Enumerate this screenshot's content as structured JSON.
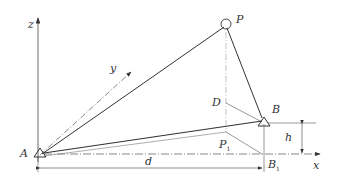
{
  "diagram": {
    "labels": {
      "z": "z",
      "y": "y",
      "x": "x",
      "P": "P",
      "A": "A",
      "B": "B",
      "D": "D",
      "P1": "P",
      "P1_sub": "1",
      "B1": "B",
      "B1_sub": "1",
      "d": "d",
      "h": "h"
    },
    "colors": {
      "line": "#333333",
      "thin": "#888888"
    }
  }
}
